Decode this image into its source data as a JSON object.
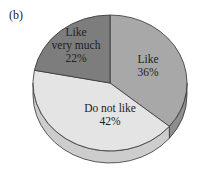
{
  "panel_label": "(b)",
  "chart_data": {
    "type": "pie",
    "style": "3d",
    "title": "",
    "slices": [
      {
        "label": "Like",
        "value": 36,
        "display": "36%",
        "color": "#a8a8a8",
        "side_color": "#8e8e8e",
        "label_lines": [
          "Like",
          "36%"
        ]
      },
      {
        "label": "Do not like",
        "value": 42,
        "display": "42%",
        "color": "#e4e4e4",
        "side_color": "#cdcdcd",
        "label_lines": [
          "Do not like",
          "42%"
        ]
      },
      {
        "label": "Like very much",
        "value": 22,
        "display": "22%",
        "color": "#7d7d7d",
        "side_color": "#666666",
        "label_lines": [
          "Like",
          "very much",
          "22%"
        ]
      }
    ],
    "start_angle_deg": 90,
    "direction": "clockwise"
  }
}
